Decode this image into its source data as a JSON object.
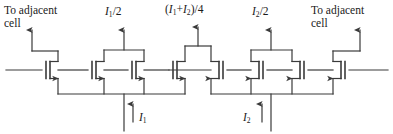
{
  "figure": {
    "type": "schematic",
    "width": 393,
    "height": 134,
    "stroke_color": "#3a3a3a",
    "text_color": "#1a1a1a",
    "background": "#ffffff"
  },
  "labels": {
    "left_adjacent_line1": "To adjacent",
    "left_adjacent_line2": "cell",
    "right_adjacent_line1": "To adjacent",
    "right_adjacent_line2": "cell",
    "out_left": "I",
    "out_left_sub": "1",
    "out_left_tail": "/2",
    "out_center_open": "(",
    "out_center_i1": "I",
    "out_center_i1_sub": "1",
    "out_center_plus": "+",
    "out_center_i2": "I",
    "out_center_i2_sub": "2",
    "out_center_tail": ")/4",
    "out_right": "I",
    "out_right_sub": "2",
    "out_right_tail": "/2",
    "source_left": "I",
    "source_left_sub": "1",
    "source_right": "I",
    "source_right_sub": "2"
  },
  "nodes": {
    "output_currents": [
      {
        "name": "left-branch-output",
        "text": "I1/2"
      },
      {
        "name": "center-branch-output",
        "text": "(I1+I2)/4"
      },
      {
        "name": "right-branch-output",
        "text": "I2/2"
      }
    ],
    "input_currents": [
      {
        "name": "input-source-left",
        "text": "I1"
      },
      {
        "name": "input-source-right",
        "text": "I2"
      }
    ],
    "terminals": [
      {
        "name": "left-adjacent-cell",
        "text": "To adjacent cell"
      },
      {
        "name": "right-adjacent-cell",
        "text": "To adjacent cell"
      }
    ]
  },
  "transistors": {
    "count": 8,
    "left_group_orientation": "source-arrow-right",
    "right_group_orientation": "source-arrow-left",
    "names": [
      "transistor-m1",
      "transistor-m2",
      "transistor-m3",
      "transistor-m4",
      "transistor-m5",
      "transistor-m6",
      "transistor-m7",
      "transistor-m8"
    ]
  }
}
